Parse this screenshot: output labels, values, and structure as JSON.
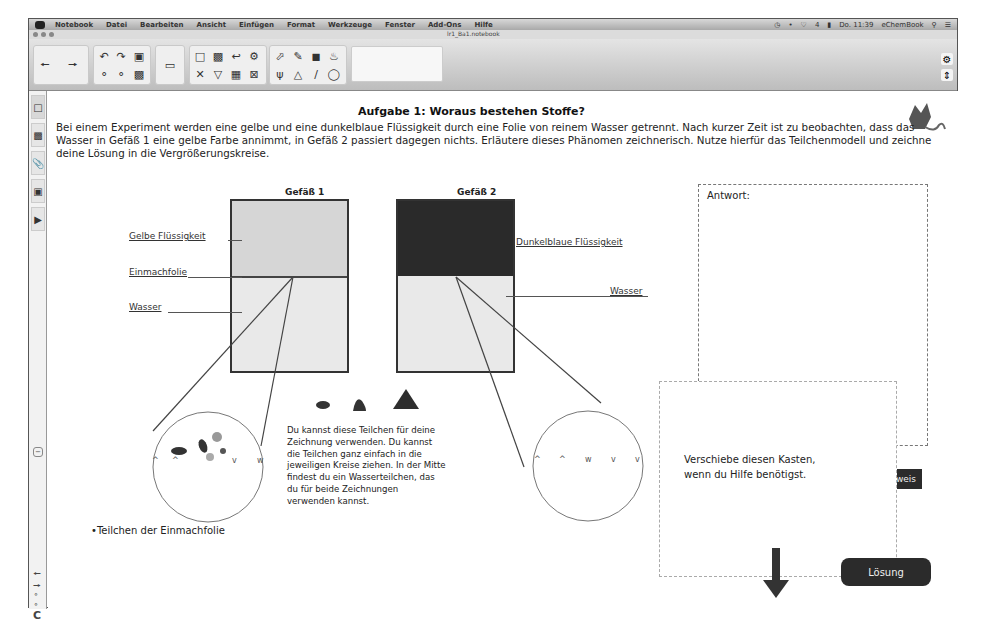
{
  "menubar": {
    "app_name": "Notebook",
    "items": [
      "Datei",
      "Bearbeiten",
      "Ansicht",
      "Einfügen",
      "Format",
      "Werkzeuge",
      "Fenster",
      "Add-Ons",
      "Hilfe"
    ],
    "status": {
      "battery": "4",
      "clock": "Do. 11:39",
      "user": "eChemBook"
    }
  },
  "window": {
    "title": "lr1_Ba1.notebook"
  },
  "toolbar": {
    "icons": [
      "back-arrow",
      "forward-arrow",
      "undo",
      "redo",
      "clear-page",
      "screen-shade",
      "insert-page",
      "table",
      "delete",
      "capture",
      "select",
      "pen",
      "eraser",
      "fill",
      "magic-pen",
      "shapes",
      "line",
      "lasso"
    ]
  },
  "sidebar": {
    "tabs": [
      "page-sorter",
      "gallery",
      "attachments",
      "properties",
      "add-ons"
    ]
  },
  "page": {
    "title": "Aufgabe 1: Woraus bestehen Stoffe?",
    "intro": "Bei einem Experiment werden eine gelbe und eine dunkelblaue Flüssigkeit durch eine Folie von reinem Wasser getrennt. Nach kurzer Zeit ist zu beobachten, dass das Wasser in Gefäß 1 eine gelbe Farbe annimmt, in Gefäß 2 passiert dagegen nichts. Erläutere dieses Phänomen zeichnerisch. Nutze hierfür das Teilchenmodell und zeichne deine Lösung in die Vergrößerungskreise.",
    "vessel1": {
      "label": "Gefäß 1",
      "labels": {
        "yellow": "Gelbe Flüssigkeit",
        "membrane": "Einmachfolie",
        "water": "Wasser"
      }
    },
    "vessel2": {
      "label": "Gefäß 2",
      "labels": {
        "blue": "Dunkelblaue Flüssigkeit",
        "water": "Wasser"
      }
    },
    "particles_hint": "Du kannst diese Teilchen für deine Zeichnung verwenden. Du kannst die Teilchen ganz einfach in die jeweiligen Kreise ziehen. In der Mitte findest du ein Wasserteilchen, das du für beide Zeichnungen verwenden kannst.",
    "membrane_caption": "Teilchen der Einmachfolie",
    "answer_label": "Antwort:",
    "help_box_text_1": "Verschiebe diesen Kasten,",
    "help_box_text_2": "wenn du Hilfe benötigst.",
    "hint_button": "weis",
    "solution_button": "Lösung"
  },
  "colors": {
    "yellow_fill": "#d6d6d6",
    "blue_fill": "#2a2a2a",
    "water_fill": "#e9e9e9",
    "button_dark": "#2b2b2b"
  }
}
